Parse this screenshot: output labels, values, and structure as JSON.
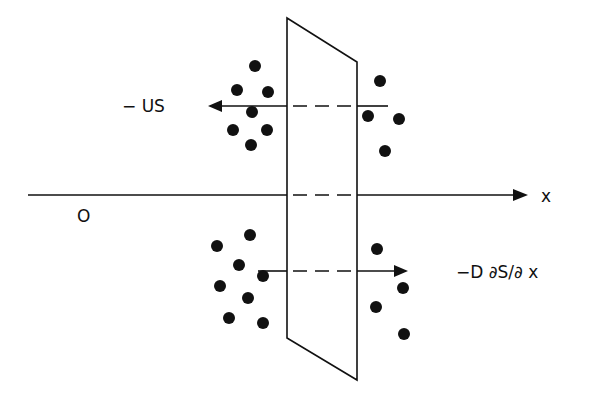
{
  "diagram": {
    "title": "",
    "labels": {
      "advection": "− US",
      "diffusion": "−D ∂S/∂ x",
      "origin": "O",
      "x_axis": "x"
    },
    "colors": {
      "ink": "#111111",
      "background": "#ffffff"
    },
    "elements": {
      "plane": {
        "shape": "parallelogram",
        "description": "control surface crossing x axis"
      },
      "upper_arrow": {
        "direction": "left",
        "meaning": "advective flux -US"
      },
      "lower_arrow": {
        "direction": "right",
        "meaning": "diffusive flux -D dS/dx"
      },
      "particles_upper_left": 7,
      "particles_upper_right": 4,
      "particles_lower_left": 8,
      "particles_lower_right": 4
    }
  }
}
